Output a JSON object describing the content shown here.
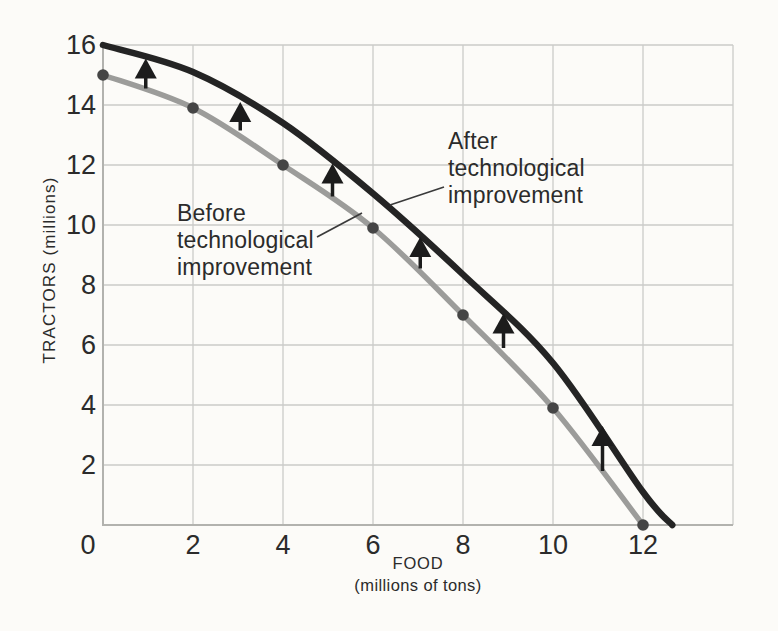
{
  "chart_data": {
    "type": "line",
    "title": "",
    "xlabel": "FOOD",
    "xlabel_sub": "(millions of tons)",
    "ylabel": "TRACTORS (millions)",
    "xlim": [
      0,
      14
    ],
    "ylim": [
      0,
      16
    ],
    "x_ticks": [
      0,
      2,
      4,
      6,
      8,
      10,
      12
    ],
    "y_ticks": [
      2,
      4,
      6,
      8,
      10,
      12,
      14,
      16
    ],
    "grid_x": [
      2,
      4,
      6,
      8,
      10,
      12,
      14
    ],
    "grid_y": [
      2,
      4,
      6,
      8,
      10,
      12,
      14,
      16
    ],
    "grid": true,
    "legend_position": "none",
    "colors": {
      "background": "#fcfbf8",
      "gridline": "#cbcbc8",
      "axis": "#b2b2ae",
      "before_curve": "#9c9c9a",
      "after_curve": "#242424",
      "marker": "#454545",
      "arrow": "#1c1c1c",
      "leader": "#3a3a3a",
      "text": "#2b2b2b"
    },
    "series": [
      {
        "name": "Before technological improvement",
        "color": "#9c9c9a",
        "width": 5.5,
        "markers": true,
        "points": [
          [
            0,
            15
          ],
          [
            2,
            13.9
          ],
          [
            4,
            12
          ],
          [
            6,
            9.9
          ],
          [
            8,
            7
          ],
          [
            10,
            3.9
          ],
          [
            12,
            0
          ]
        ]
      },
      {
        "name": "After technological improvement",
        "color": "#242424",
        "width": 6.5,
        "markers": false,
        "points": [
          [
            0,
            16
          ],
          [
            2,
            15.1
          ],
          [
            4,
            13.4
          ],
          [
            6,
            11.05
          ],
          [
            8,
            8.35
          ],
          [
            10,
            5.4
          ],
          [
            12,
            1.1
          ],
          [
            12.65,
            0
          ]
        ]
      }
    ],
    "arrows": [
      {
        "x": 0.95,
        "y0": 14.55,
        "y1": 15.55
      },
      {
        "x": 3.05,
        "y0": 13.15,
        "y1": 14.1
      },
      {
        "x": 5.1,
        "y0": 10.95,
        "y1": 12.05
      },
      {
        "x": 7.05,
        "y0": 8.55,
        "y1": 9.6
      },
      {
        "x": 8.9,
        "y0": 5.9,
        "y1": 7.05
      },
      {
        "x": 11.1,
        "y0": 1.8,
        "y1": 3.3
      }
    ],
    "annotations": [
      {
        "id": "before",
        "text": "Before\ntechnological\nimprovement",
        "leader": {
          "x1": 317,
          "y1": 237,
          "x2": 362,
          "y2": 213
        }
      },
      {
        "id": "after",
        "text": "After\ntechnological\nimprovement",
        "leader": {
          "x1": 444,
          "y1": 187,
          "x2": 390,
          "y2": 205
        }
      }
    ]
  }
}
